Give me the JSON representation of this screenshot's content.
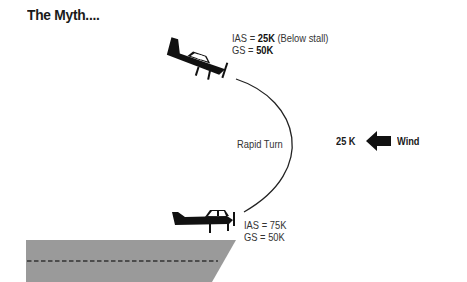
{
  "title": "The Myth....",
  "top_aircraft": {
    "ias_label": "IAS = ",
    "ias_value": "25K",
    "ias_note": " (Below stall)",
    "gs_label": "GS = ",
    "gs_value": "50K"
  },
  "turn_label": "Rapid Turn",
  "bottom_aircraft": {
    "ias_line": "IAS = 75K",
    "gs_line": "GS = 50K"
  },
  "wind": {
    "speed": "25 K",
    "label": "Wind",
    "direction_icon": "arrow-left-icon"
  },
  "colors": {
    "ink": "#111111",
    "runway": "#9a9a9a",
    "runway_centerline": "#333333"
  }
}
